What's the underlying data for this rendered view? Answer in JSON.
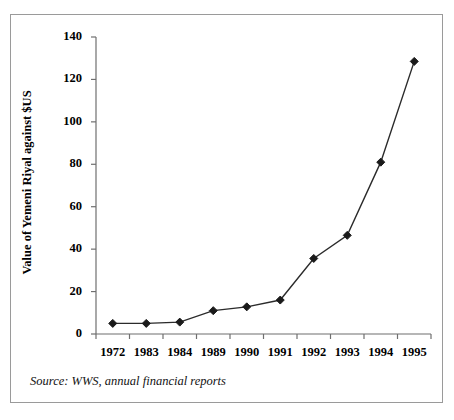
{
  "figure": {
    "source_note": "Source: WWS, annual financial reports",
    "border_color": "#9a9a9a",
    "background": "#ffffff",
    "line_color": "#2b2b2b",
    "marker_color": "#1a1a1a",
    "axis_color": "#6f6f6f"
  },
  "chart_data": {
    "type": "line",
    "title": "",
    "xlabel": "",
    "ylabel": "Value of Yemeni Riyal against $US",
    "categories": [
      "1972",
      "1983",
      "1984",
      "1989",
      "1990",
      "1991",
      "1992",
      "1993",
      "1994",
      "1995"
    ],
    "values": [
      5,
      5,
      5.6,
      11,
      12.8,
      16,
      35.6,
      46.5,
      81,
      128.5
    ],
    "series": [
      {
        "name": "Value of Yemeni Riyal against $US",
        "values": [
          5,
          5,
          5.6,
          11,
          12.8,
          16,
          35.6,
          46.5,
          81,
          128.5
        ]
      }
    ],
    "ylim": [
      0,
      140
    ],
    "yticks": [
      0,
      20,
      40,
      60,
      80,
      100,
      120,
      140
    ],
    "ytick_labels": [
      "0",
      "20",
      "40",
      "60",
      "80",
      "100",
      "120",
      "140"
    ],
    "grid": false,
    "legend": false,
    "legend_position": "none",
    "marker": "diamond"
  }
}
